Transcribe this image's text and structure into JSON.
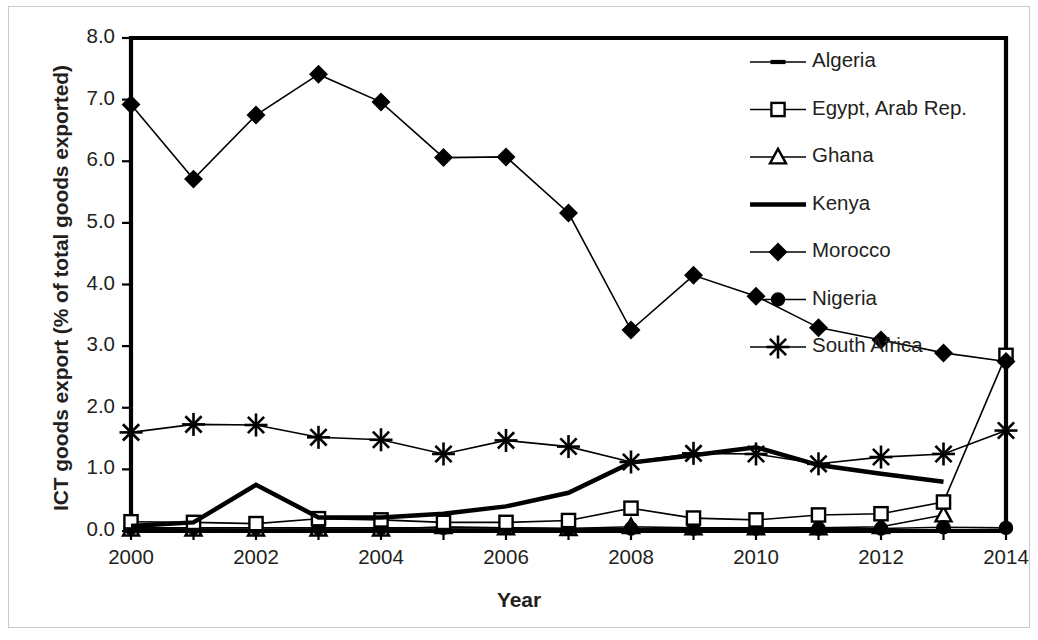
{
  "chart_data": {
    "type": "line",
    "title": "",
    "xlabel": "Year",
    "ylabel": "ICT goods export (% of total goods exported)",
    "x": [
      2000,
      2001,
      2002,
      2003,
      2004,
      2005,
      2006,
      2007,
      2008,
      2009,
      2010,
      2011,
      2012,
      2013,
      2014
    ],
    "categories": [
      "2000",
      "2001",
      "2002",
      "2003",
      "2004",
      "2005",
      "2006",
      "2007",
      "2008",
      "2009",
      "2010",
      "2011",
      "2012",
      "2013",
      "2014"
    ],
    "xtick_labels": [
      "2000",
      "2002",
      "2004",
      "2006",
      "2008",
      "2010",
      "2012",
      "2014"
    ],
    "ytick_labels": [
      "0.0",
      "1.0",
      "2.0",
      "3.0",
      "4.0",
      "5.0",
      "6.0",
      "7.0",
      "8.0"
    ],
    "xlim": [
      2000,
      2014
    ],
    "ylim": [
      0.0,
      8.0
    ],
    "ystep": 1.0,
    "grid": false,
    "legend_position": "inside-top-right",
    "line_color": "#000000",
    "background_color": "#ffffff",
    "series": [
      {
        "name": "Algeria",
        "marker": "dash",
        "line_width": 1.6,
        "values": [
          0.04,
          0.03,
          0.02,
          0.03,
          0.03,
          0.03,
          0.03,
          0.02,
          0.02,
          0.02,
          0.02,
          0.02,
          0.02,
          0.02,
          null
        ]
      },
      {
        "name": "Egypt, Arab Rep.",
        "marker": "open-square",
        "line_width": 1.6,
        "values": [
          0.15,
          0.14,
          0.12,
          0.2,
          0.18,
          0.14,
          0.14,
          0.17,
          0.37,
          0.21,
          0.18,
          0.26,
          0.28,
          0.47,
          2.85
        ]
      },
      {
        "name": "Ghana",
        "marker": "open-triangle",
        "line_width": 1.6,
        "values": [
          0.03,
          0.03,
          0.03,
          0.03,
          0.03,
          0.07,
          0.05,
          0.04,
          0.07,
          0.05,
          0.05,
          0.05,
          0.07,
          0.26,
          null
        ]
      },
      {
        "name": "Kenya",
        "marker": "none",
        "line_width": 4.5,
        "values": [
          0.08,
          0.14,
          0.75,
          0.22,
          0.22,
          0.28,
          0.4,
          0.62,
          1.11,
          1.23,
          1.36,
          1.07,
          0.93,
          0.8,
          null
        ]
      },
      {
        "name": "Morocco",
        "marker": "filled-diamond",
        "line_width": 1.6,
        "values": [
          6.92,
          5.71,
          6.75,
          7.41,
          6.96,
          6.06,
          6.07,
          5.16,
          3.26,
          4.15,
          3.81,
          3.3,
          3.1,
          2.89,
          2.75
        ]
      },
      {
        "name": "Nigeria",
        "marker": "filled-circle",
        "line_width": 1.6,
        "values": [
          0.05,
          0.05,
          0.05,
          0.05,
          0.05,
          0.05,
          0.05,
          0.04,
          0.04,
          0.04,
          0.04,
          0.04,
          0.04,
          0.06,
          0.05
        ]
      },
      {
        "name": "South Africa",
        "marker": "asterisk",
        "line_width": 1.6,
        "values": [
          1.6,
          1.73,
          1.72,
          1.52,
          1.48,
          1.25,
          1.47,
          1.37,
          1.12,
          1.26,
          1.25,
          1.09,
          1.2,
          1.25,
          1.63
        ]
      }
    ]
  },
  "axis": {
    "x_title": "Year",
    "y_title": "ICT goods export (% of total goods exported)"
  }
}
